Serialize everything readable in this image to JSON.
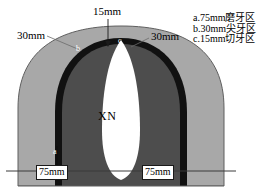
{
  "diagram": {
    "title_labels": {
      "top_measure": "15mm",
      "left_measure": "30mm",
      "right_measure": "30mm",
      "bottom_left_measure": "75mm",
      "bottom_right_measure": "75mm",
      "center_label": "XN"
    },
    "markers": {
      "marker_a": "a",
      "marker_b": "b",
      "marker_c": "c"
    },
    "colors": {
      "outer_zone": "#a8a8a8",
      "middle_band": "#111111",
      "inner_zone": "#4d4d4d",
      "center_void": "#ffffff",
      "outline": "#5a5a5a",
      "baseline": "#333333"
    }
  },
  "legend": {
    "items": [
      "a.75mm磨牙区",
      "b.30mm尖牙区",
      "c.15mm切牙区"
    ]
  }
}
